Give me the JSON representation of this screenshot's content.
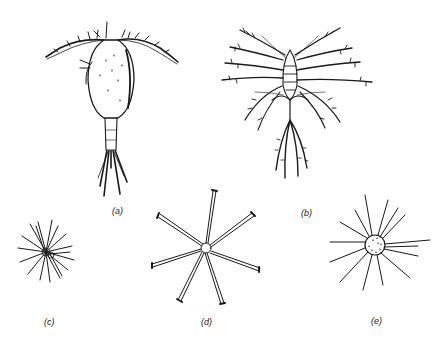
{
  "figure": {
    "panels": [
      {
        "id": "a",
        "label": "(a)",
        "subject": "copepod-like crustacean with two antennae and forked tail setae"
      },
      {
        "id": "b",
        "label": "(b)",
        "subject": "plumose larval crustacean with feathery appendages"
      },
      {
        "id": "c",
        "label": "(c)",
        "subject": "small spiny cell with radiating spines"
      },
      {
        "id": "d",
        "label": "(d)",
        "subject": "star-shaped colony with seven rod-like arms"
      },
      {
        "id": "e",
        "label": "(e)",
        "subject": "spherical cell with radiating fine spines"
      }
    ],
    "colors": {
      "ink": "#1a1a1a",
      "background": "#ffffff"
    }
  }
}
